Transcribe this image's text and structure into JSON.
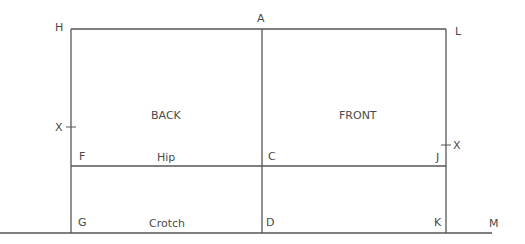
{
  "diagram": {
    "type": "pattern-draft",
    "points": {
      "H": "H",
      "A": "A",
      "L": "L",
      "X_left": "X",
      "X_right": "X",
      "F": "F",
      "C": "C",
      "J": "J",
      "G": "G",
      "D": "D",
      "K": "K",
      "M": "M"
    },
    "panels": {
      "back": "BACK",
      "front": "FRONT"
    },
    "lines": {
      "hip": "Hip",
      "crotch": "Crotch"
    },
    "colors": {
      "line": "#555555",
      "text": "#4a4a4a",
      "background": "#ffffff"
    }
  }
}
